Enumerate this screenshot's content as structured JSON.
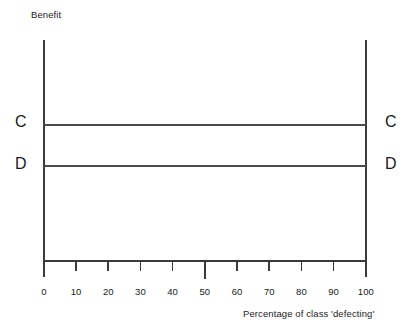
{
  "chart_data": {
    "type": "line",
    "title": "",
    "ylabel": "Benefit",
    "xlabel": "Percentage of class 'defecting'",
    "xlim": [
      0,
      100
    ],
    "ylim": [
      0,
      100
    ],
    "grid": false,
    "legend_position": "inline-ends",
    "xticks": [
      0,
      10,
      20,
      30,
      40,
      50,
      60,
      70,
      80,
      90,
      100
    ],
    "xtick_labels": [
      "0",
      "10",
      "20",
      "30",
      "40",
      "50",
      "60",
      "70",
      "80",
      "90",
      "100"
    ],
    "yticks": [],
    "ytick_labels": [],
    "series": [
      {
        "name": "C",
        "label_left": "C",
        "label_right": "C",
        "x": [
          0,
          100
        ],
        "values": [
          62,
          62
        ],
        "style": "solid-horizontal"
      },
      {
        "name": "D",
        "label_left": "D",
        "label_right": "D",
        "x": [
          0,
          100
        ],
        "values": [
          44,
          44
        ],
        "style": "solid-horizontal"
      }
    ],
    "annotations": [
      {
        "text": "C",
        "position": "left-axis-outside"
      },
      {
        "text": "C",
        "position": "right-axis-outside"
      },
      {
        "text": "D",
        "position": "left-axis-outside"
      },
      {
        "text": "D",
        "position": "right-axis-outside"
      }
    ],
    "colors": {
      "axis": "#3a3a3a",
      "series_c": "#4a4a4a",
      "series_d": "#4a4a4a",
      "text": "#222222",
      "background": "#ffffff"
    }
  }
}
